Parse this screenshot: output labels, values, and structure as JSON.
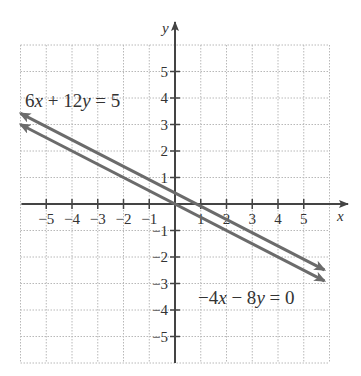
{
  "chart_data": {
    "type": "line",
    "title": "",
    "xlabel": "x",
    "ylabel": "y",
    "xlim": [
      -6,
      6
    ],
    "ylim": [
      -6,
      6
    ],
    "grid": true,
    "x_ticks": [
      -5,
      -4,
      -3,
      -2,
      -1,
      1,
      2,
      3,
      4,
      5
    ],
    "y_ticks": [
      -5,
      -4,
      -3,
      -2,
      -1,
      1,
      2,
      3,
      4,
      5
    ],
    "x_tick_labels": [
      "−5",
      "−4",
      "−3",
      "−2",
      "−1",
      "1",
      "2",
      "3",
      "4",
      "5"
    ],
    "y_tick_labels": [
      "−5",
      "−4",
      "−3",
      "−2",
      "−1",
      "1",
      "2",
      "3",
      "4",
      "5"
    ],
    "series": [
      {
        "name": "6x + 12y = 5",
        "equation": "y = 5/12 - x/2",
        "x": [
          -6,
          5.8
        ],
        "y": [
          3.417,
          -2.483
        ],
        "arrows": "both",
        "color": "#6b6b6b"
      },
      {
        "name": "−4x − 8y = 0",
        "equation": "y = -x/2",
        "x": [
          -6,
          5.8
        ],
        "y": [
          3,
          -2.9
        ],
        "arrows": "both",
        "color": "#6b6b6b"
      }
    ],
    "annotations": [
      {
        "text": "6x + 12y = 5",
        "position": "upper-left"
      },
      {
        "text": "−4x − 8y = 0",
        "position": "lower-right"
      }
    ]
  },
  "labels": {
    "x_axis": "x",
    "y_axis": "y",
    "eq1": {
      "parts": [
        "6",
        "x",
        " + 12",
        "y",
        " = 5"
      ]
    },
    "eq2": {
      "parts": [
        "−4",
        "x",
        " − 8",
        "y",
        " = 0"
      ]
    }
  },
  "colors": {
    "axis": "#444444",
    "grid": "#b8b8b8",
    "line": "#6b6b6b",
    "text": "#333333"
  }
}
